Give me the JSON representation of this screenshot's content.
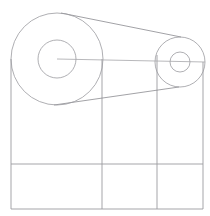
{
  "document": {
    "title": "Belt Drive Pulley Assembly",
    "type": "technical-line-drawing",
    "background_color": "#ffffff",
    "line_color": "#8a8a8f",
    "width": 210,
    "height": 216
  },
  "corner_mark": {
    "name": "partial-glyph-mark",
    "color": "#2b2b2b",
    "x": 9,
    "y": -5,
    "width": 9,
    "height": 8
  },
  "geometry": {
    "driver_pulley": {
      "label": "large-pulley",
      "center_x": 57,
      "center_y": 59,
      "outer_radius": 46,
      "inner_radius": 19
    },
    "driven_pulley": {
      "label": "small-pulley",
      "center_x": 180,
      "center_y": 62,
      "outer_radius": 25,
      "inner_radius": 10
    },
    "center_axis": {
      "label": "center-distance-axis",
      "x1": 57,
      "y1": 59,
      "x2": 205,
      "y2": 62
    },
    "belt_upper": {
      "label": "belt-upper-tangent",
      "x1": 61,
      "y1": 13,
      "x2": 181,
      "y2": 37
    },
    "belt_lower": {
      "label": "belt-lower-tangent",
      "x1": 54,
      "y1": 105,
      "x2": 179,
      "y2": 87
    },
    "frame": {
      "label": "base-frame-rectangle",
      "left": 11,
      "right": 203,
      "top": 59,
      "bottom": 209
    },
    "grid_verticals": [
      {
        "label": "grid-vertical-left",
        "x": 11,
        "y_top": 59,
        "y_bottom": 209
      },
      {
        "label": "grid-vertical-mid",
        "x": 102,
        "y_top": 59,
        "y_bottom": 209
      },
      {
        "label": "grid-vertical-right-inner",
        "x": 157,
        "y_top": 55,
        "y_bottom": 209
      },
      {
        "label": "grid-vertical-right",
        "x": 203,
        "y_top": 62,
        "y_bottom": 209
      }
    ],
    "grid_horizontals": [
      {
        "label": "grid-horizontal-divider",
        "y": 164,
        "x_left": 11,
        "x_right": 203
      },
      {
        "label": "grid-horizontal-base",
        "y": 209,
        "x_left": 11,
        "x_right": 203
      }
    ]
  }
}
